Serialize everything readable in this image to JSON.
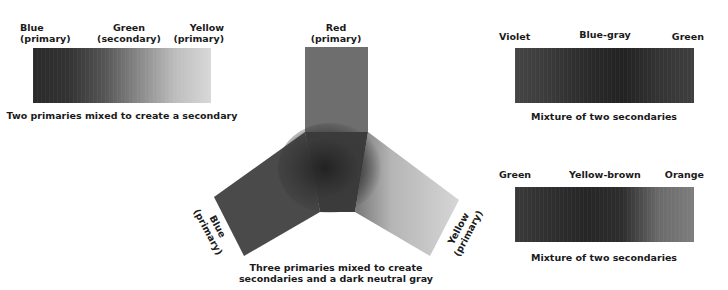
{
  "swatch1": {
    "labels": [
      {
        "line1": "Blue",
        "line2": "(primary)"
      },
      {
        "line1": "Green",
        "line2": "(secondary)"
      },
      {
        "line1": "Yellow",
        "line2": "(primary)"
      }
    ],
    "caption": "Two primaries mixed to create a secondary",
    "gradient": [
      "#2a2a2a",
      "#333333",
      "#555555",
      "#8a8a8a",
      "#bdbdbd",
      "#d8d8d8"
    ]
  },
  "wheel": {
    "top_label": {
      "line1": "Red",
      "line2": "(primary)"
    },
    "left_label": {
      "line1": "Blue",
      "line2": "(primary)"
    },
    "right_label": {
      "line1": "Yellow",
      "line2": "(primary)"
    },
    "caption_line1": "Three primaries mixed to create",
    "caption_line2": "secondaries and a dark neutral gray",
    "colors": {
      "red": "#6e6e6e",
      "blue": "#4a4a4a",
      "yellow": "#cfcfcf",
      "center": "#2a2a2a"
    }
  },
  "swatch2": {
    "labels": [
      "Violet",
      "Blue-gray",
      "Green"
    ],
    "caption": "Mixture of two secondaries",
    "gradient": [
      "#454545",
      "#3a3a3a",
      "#2b2b2b",
      "#222222",
      "#343434",
      "#3f3f3f"
    ]
  },
  "swatch3": {
    "labels": [
      "Green",
      "Yellow-brown",
      "Orange"
    ],
    "caption": "Mixture of two secondaries",
    "gradient": [
      "#3a3a3a",
      "#2f2f2f",
      "#262626",
      "#2e2e2e",
      "#6a6a6a",
      "#7d7d7d"
    ]
  }
}
